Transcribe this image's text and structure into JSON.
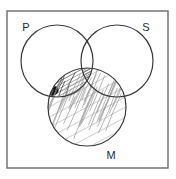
{
  "figure": {
    "kind": "three-circle-venn-diagram",
    "title": "",
    "background_color": "#ffffff",
    "frame": {
      "name": "outer-border-box",
      "x": 7,
      "y": 11,
      "width": 161,
      "height": 157,
      "stroke_color": "#6b6b6b",
      "stroke_width": 1.4,
      "fill": "none"
    },
    "stroke_color": "#3a3a3a",
    "stroke_width": 1.2,
    "hatch_color": "#4a4a4a",
    "hatch_light_color": "#9a9a9a",
    "solid_fill_color": "#111111",
    "circles": [
      {
        "id": "P",
        "label": "P",
        "cx": 57,
        "cy": 61,
        "r": 36,
        "label_x": 26,
        "label_y": 31,
        "label_position": "top-left"
      },
      {
        "id": "S",
        "label": "S",
        "cx": 117,
        "cy": 61,
        "r": 36,
        "label_x": 146,
        "label_y": 31,
        "label_position": "top-right"
      },
      {
        "id": "M",
        "label": "M",
        "cx": 87,
        "cy": 107,
        "r": 39,
        "label_x": 111,
        "label_y": 159,
        "label_position": "bottom-center-right"
      }
    ],
    "shaded_regions": [
      {
        "name": "m-circle-shading",
        "region": "M",
        "style": "light-hand-drawn-hatch",
        "description": "whole M circle filled with sparse light diagonal strokes"
      },
      {
        "name": "p-and-m-overlap-shading",
        "region": "P ∩ M",
        "style": "dense-diagonal-hatch",
        "description": "dense dark diagonal hatching in the lens where P and M overlap"
      },
      {
        "name": "p-s-m-core-shading",
        "region": "P ∩ S ∩ M",
        "style": "very-dense-hatch",
        "description": "darkest hatching at the centre where all three circles overlap"
      },
      {
        "name": "solid-dark-spot",
        "region": "P ∩ M left tip",
        "style": "solid-fill",
        "description": "small solid black blob at the left tip of the P∩M lens"
      }
    ]
  }
}
